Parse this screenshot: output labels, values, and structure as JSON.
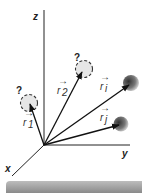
{
  "diagram": {
    "axes": {
      "x_label": "x",
      "y_label": "y",
      "z_label": "z"
    },
    "vectors": [
      {
        "id": "r1",
        "label": "r",
        "subscript": "1",
        "target": "unknown-position-1"
      },
      {
        "id": "r2",
        "label": "r",
        "subscript": "2",
        "target": "unknown-position-2"
      },
      {
        "id": "ri",
        "label": "r",
        "subscript": "i",
        "target": "particle-i"
      },
      {
        "id": "rj",
        "label": "r",
        "subscript": "j",
        "target": "particle-j"
      }
    ],
    "unknown_marker": "?",
    "arrow_symbol": "→",
    "colors": {
      "axis": "#222222",
      "vector": "#111111",
      "sphere_dark": "#444444",
      "sphere_light": "#d0d0d0",
      "dashed_circle_fill": "#e6e6e6",
      "bottom_bar": "#9a9a9a"
    }
  }
}
